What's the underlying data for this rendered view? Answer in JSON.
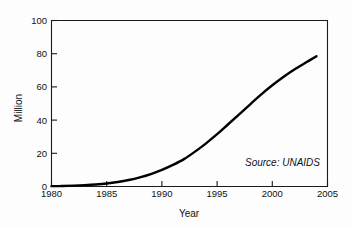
{
  "chart_data": {
    "type": "line",
    "title": "",
    "subtitle": "",
    "xlabel": "Year",
    "ylabel": "Million",
    "xlim": [
      1980,
      2005
    ],
    "ylim": [
      0,
      100
    ],
    "grid": false,
    "legend": null,
    "annotations": [
      {
        "name": "source-note",
        "text": "Source: UNAIDS",
        "style": "italic",
        "x": 2000.5,
        "y": 14
      }
    ],
    "xticks": [
      1980,
      1985,
      1990,
      1995,
      2000,
      2005
    ],
    "xticklabels": [
      "1980",
      "1985",
      "1990",
      "1995",
      "2000",
      "2005"
    ],
    "yticks": [
      0,
      20,
      40,
      60,
      80,
      100
    ],
    "yticklabels": [
      "0",
      "20",
      "40",
      "60",
      "80",
      "100"
    ],
    "series": [
      {
        "name": "Cumulative HIV infections",
        "color": "#000000",
        "x": [
          1980,
          1981,
          1982,
          1983,
          1984,
          1985,
          1986,
          1987,
          1988,
          1989,
          1990,
          1991,
          1992,
          1993,
          1994,
          1995,
          1996,
          1997,
          1998,
          1999,
          2000,
          2001,
          2002,
          2003,
          2004
        ],
        "values": [
          0.2,
          0.3,
          0.5,
          0.8,
          1.2,
          1.8,
          2.7,
          3.9,
          5.5,
          7.5,
          10.0,
          13.0,
          16.5,
          21.0,
          26.0,
          31.5,
          37.5,
          43.5,
          49.5,
          55.5,
          61.0,
          66.0,
          70.5,
          74.5,
          78.5
        ]
      }
    ]
  },
  "axes": {
    "y_axis_title": "Million",
    "x_axis_title": "Year"
  }
}
